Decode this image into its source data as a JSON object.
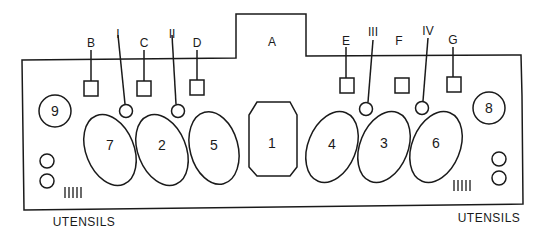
{
  "diagram": {
    "top_label": "A",
    "square_labels": [
      "B",
      "C",
      "D",
      "E",
      "F",
      "G"
    ],
    "roman_labels": [
      "I",
      "II",
      "III",
      "IV"
    ],
    "center_number": "1",
    "oval_numbers": [
      "7",
      "2",
      "5",
      "4",
      "3",
      "6"
    ],
    "corner_numbers": [
      "9",
      "8"
    ],
    "utensils_left": "UTENSILS",
    "utensils_right": "UTENSILS",
    "utensil_marks": "|||||"
  }
}
